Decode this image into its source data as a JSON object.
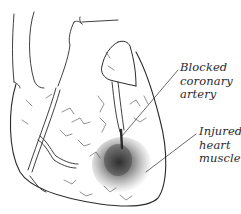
{
  "diagram": {
    "labels": {
      "blocked_artery": {
        "lines": [
          "Blocked",
          "coronary",
          "artery"
        ]
      },
      "injured_muscle": {
        "lines": [
          "Injured",
          "heart",
          "muscle"
        ]
      }
    },
    "colors": {
      "ink": "#2a2a2a",
      "background": "#ffffff",
      "shading": "#1a1a1a"
    }
  }
}
